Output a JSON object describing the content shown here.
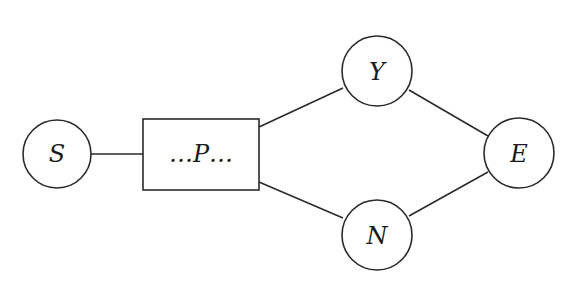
{
  "diagram": {
    "type": "flow-graph",
    "nodes": [
      {
        "id": "S",
        "label": "S",
        "shape": "circle",
        "cx": 57,
        "cy": 154,
        "r": 34
      },
      {
        "id": "P",
        "label": "…P…",
        "shape": "rectangle",
        "x": 143,
        "y": 119,
        "w": 116,
        "h": 71
      },
      {
        "id": "Y",
        "label": "Y",
        "shape": "circle",
        "cx": 377,
        "cy": 71,
        "r": 35
      },
      {
        "id": "N",
        "label": "N",
        "shape": "circle",
        "cx": 377,
        "cy": 235,
        "r": 35
      },
      {
        "id": "E",
        "label": "E",
        "shape": "circle",
        "cx": 519,
        "cy": 153,
        "r": 35
      }
    ],
    "edges": [
      {
        "from": "S",
        "to": "P"
      },
      {
        "from": "P",
        "to": "Y"
      },
      {
        "from": "P",
        "to": "N"
      },
      {
        "from": "Y",
        "to": "E"
      },
      {
        "from": "N",
        "to": "E"
      }
    ],
    "colors": {
      "stroke": "#2a2a2a",
      "background": "#ffffff",
      "text": "#1a1a1a"
    }
  }
}
